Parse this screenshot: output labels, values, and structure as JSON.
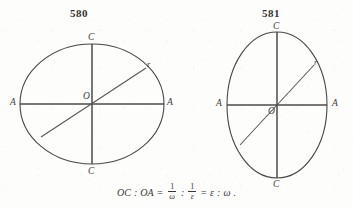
{
  "page": {
    "background_color": "#fdfdfc",
    "ink_color": "#474747",
    "width": 353,
    "height": 207
  },
  "figures": [
    {
      "number": "580",
      "shape": "ellipse",
      "orientation": "horizontal-major-axis",
      "center_label": "O",
      "labels": {
        "left_vertex": "A",
        "right_vertex": "A",
        "top_vertex": "C",
        "bottom_vertex": "C",
        "radius": "r"
      },
      "geometry": {
        "center_x": 92,
        "center_y": 104,
        "radius_x": 72,
        "radius_y": 60,
        "radius_line_angle_deg": 28
      }
    },
    {
      "number": "581",
      "shape": "ellipse",
      "orientation": "vertical-major-axis",
      "center_label": "O",
      "labels": {
        "left_vertex": "A",
        "right_vertex": "A",
        "top_vertex": "C",
        "bottom_vertex": "C",
        "radius": "r"
      },
      "geometry": {
        "center_x": 277,
        "center_y": 105,
        "radius_x": 50,
        "radius_y": 73,
        "radius_line_angle_deg": 38
      }
    }
  ],
  "formula": {
    "lhs_first": "OC",
    "ratio_sep_1": ":",
    "lhs_second": "OA",
    "equals_1": "=",
    "frac_1": {
      "numerator": "1",
      "denominator": "ω"
    },
    "ratio_sep_2": ":",
    "frac_2": {
      "numerator": "1",
      "denominator": "ε"
    },
    "equals_2": "=",
    "rhs_first": "ε",
    "ratio_sep_3": ":",
    "rhs_second": "ω",
    "period": "."
  }
}
